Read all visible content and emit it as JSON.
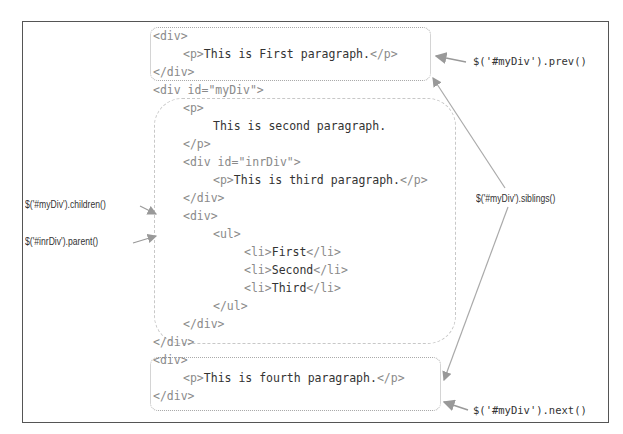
{
  "diagram": {
    "code_lines": [
      {
        "id": "l1",
        "text": "<div>",
        "x": 153,
        "y": 29
      },
      {
        "id": "l2",
        "pre": "<p>",
        "mid": "This is First paragraph.",
        "post": "</p>",
        "x": 183,
        "y": 47
      },
      {
        "id": "l3",
        "text": "</div>",
        "x": 153,
        "y": 65
      },
      {
        "id": "l4",
        "text": "<div id=\"myDiv\">",
        "x": 153,
        "y": 83
      },
      {
        "id": "l5",
        "text": "<p>",
        "x": 183,
        "y": 101
      },
      {
        "id": "l6",
        "mid": "This is second paragraph.",
        "x": 213,
        "y": 119
      },
      {
        "id": "l7",
        "text": "</p>",
        "x": 183,
        "y": 137
      },
      {
        "id": "l8",
        "text": "<div id=\"inrDiv\">",
        "x": 183,
        "y": 155
      },
      {
        "id": "l9",
        "pre": "<p>",
        "mid": "This is third paragraph.",
        "post": "</p>",
        "x": 213,
        "y": 173
      },
      {
        "id": "l10",
        "text": "</div>",
        "x": 183,
        "y": 191
      },
      {
        "id": "l11",
        "text": "<div>",
        "x": 183,
        "y": 209
      },
      {
        "id": "l12",
        "text": "<ul>",
        "x": 213,
        "y": 227
      },
      {
        "id": "l13",
        "pre": "<li>",
        "mid": "First",
        "post": "</li>",
        "x": 244,
        "y": 245
      },
      {
        "id": "l14",
        "pre": "<li>",
        "mid": "Second",
        "post": "</li>",
        "x": 244,
        "y": 263
      },
      {
        "id": "l15",
        "pre": "<li>",
        "mid": "Third",
        "post": "</li>",
        "x": 244,
        "y": 281
      },
      {
        "id": "l16",
        "text": "</ul>",
        "x": 213,
        "y": 299
      },
      {
        "id": "l17",
        "text": "</div>",
        "x": 183,
        "y": 317
      },
      {
        "id": "l18",
        "text": "</div>",
        "x": 153,
        "y": 335
      },
      {
        "id": "l19",
        "text": "<div>",
        "x": 153,
        "y": 353
      },
      {
        "id": "l20",
        "pre": "<p>",
        "mid": "This is fourth paragraph.",
        "post": "</p>",
        "x": 183,
        "y": 371
      },
      {
        "id": "l21",
        "text": "</div>",
        "x": 153,
        "y": 389
      }
    ],
    "labels": {
      "prev": "$('#myDiv').prev()",
      "siblings": "$('#myDiv').siblings()",
      "children": "$('#myDiv').children()",
      "parent": "$('#inrDiv').parent()",
      "next": "$('#myDiv').next()"
    }
  }
}
